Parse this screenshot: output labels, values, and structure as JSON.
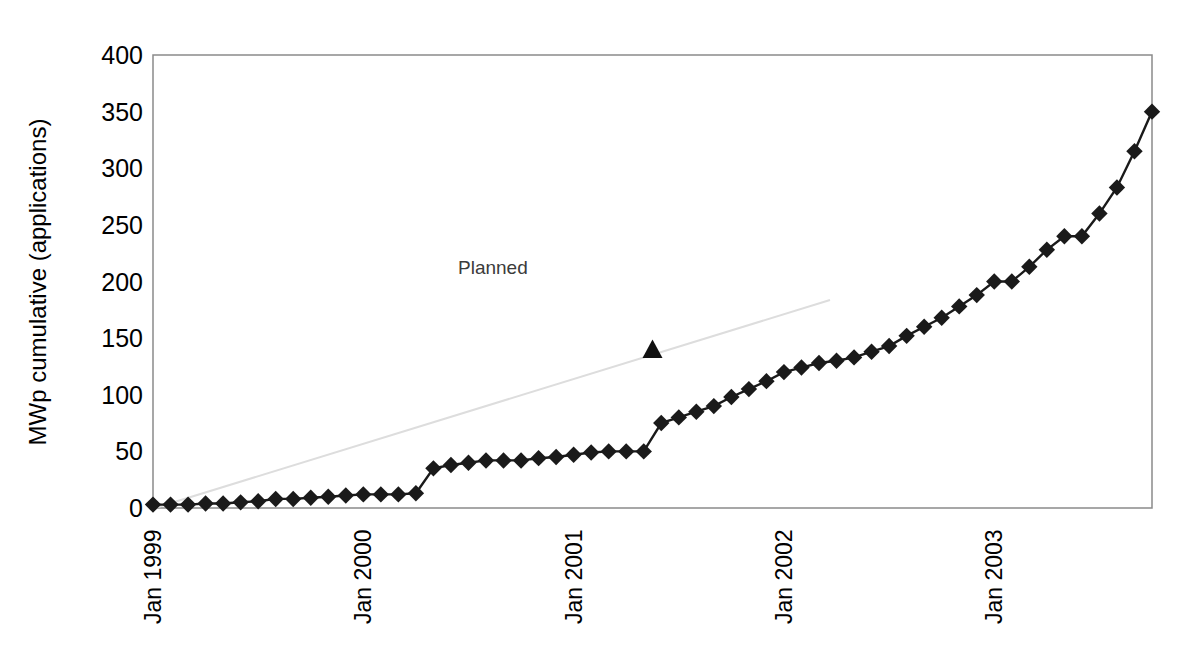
{
  "chart_data": {
    "type": "line",
    "title": "",
    "xlabel": "",
    "ylabel": "MWp cumulative (applications)",
    "ylim": [
      0,
      400
    ],
    "yticks": [
      0,
      50,
      100,
      150,
      200,
      250,
      300,
      350,
      400
    ],
    "ytick_labels": [
      "0",
      "50",
      "100",
      "150",
      "200",
      "250",
      "300",
      "350",
      "400"
    ],
    "xtick_labels": [
      "Jan 1999",
      "Jan 2000",
      "Jan 2001",
      "Jan 2002",
      "Jan 2003"
    ],
    "xtick_months": [
      0,
      12,
      24,
      36,
      48
    ],
    "xlim_months": [
      0,
      57
    ],
    "grid": false,
    "legend": "none",
    "frame": true,
    "marker": "diamond",
    "marker_color": "#1a1a1a",
    "line_color": "#1a1a1a",
    "series": [
      {
        "name": "Actual (applications, cumulative)",
        "marker": "diamond",
        "x_months": [
          0,
          1,
          2,
          3,
          4,
          5,
          6,
          7,
          8,
          9,
          10,
          11,
          12,
          13,
          14,
          15,
          16,
          17,
          18,
          19,
          20,
          21,
          22,
          23,
          24,
          25,
          26,
          27,
          28,
          29,
          30,
          31,
          32,
          33,
          34,
          35,
          36,
          37,
          38,
          39,
          40,
          41,
          42,
          43,
          44,
          45,
          46,
          47,
          48,
          49,
          50,
          51,
          52,
          53,
          54,
          55,
          56
        ],
        "values": [
          3,
          3,
          3,
          4,
          4,
          5,
          6,
          8,
          8,
          9,
          10,
          11,
          12,
          12,
          12,
          13,
          35,
          38,
          40,
          42,
          42,
          42,
          44,
          45,
          47,
          49,
          50,
          50,
          50,
          75,
          80,
          85,
          90,
          98,
          105,
          112,
          120,
          124,
          128,
          130,
          133,
          138,
          143,
          152,
          160,
          168,
          178,
          188,
          200,
          200,
          213,
          228,
          240,
          240,
          260,
          283,
          315,
          350
        ]
      },
      {
        "name": "Planned",
        "marker": "triangle",
        "style": "faint-trend-line",
        "color": "#d5d5d5",
        "x_months": [
          0,
          48
        ],
        "values": [
          0,
          185
        ],
        "marker_point": {
          "x_months": 28.5,
          "value": 140
        }
      }
    ],
    "annotations": [
      {
        "text": "Planned",
        "x_months": 18.0,
        "value": 230
      }
    ]
  },
  "axis": {
    "y_title": "MWp cumulative (applications)"
  }
}
